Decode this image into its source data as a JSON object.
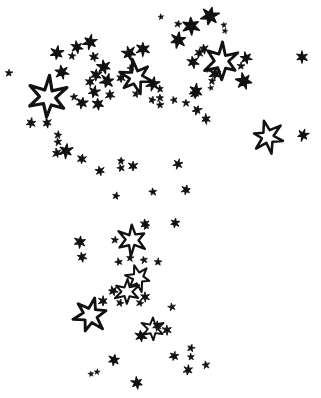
{
  "canvas": {
    "name": "star-field-illustration",
    "width": 321,
    "height": 398,
    "background_color": "#ffffff",
    "ink_color": "#111111",
    "description": "Hand-drawn black-ink star field scatter on plain white paper"
  },
  "legend": {
    "filled_style_label": "filled star",
    "outlined_style_label": "outlined star",
    "dot_style_label": "dot"
  },
  "chart_data": {
    "type": "scatter",
    "title": "",
    "subtitle": "",
    "xlabel": "",
    "ylabel": "",
    "xlim": [
      0,
      321
    ],
    "ylim": [
      0,
      398
    ],
    "grid": false,
    "legend_position": "none",
    "axis_visible": false,
    "tick_labels_x": [],
    "tick_labels_y": [],
    "annotations": [],
    "series": [
      {
        "name": "outlined star",
        "marker": "star-outline",
        "color": "#111111",
        "points": [
          {
            "x": 48,
            "y": 97,
            "size": 20
          },
          {
            "x": 136,
            "y": 77,
            "size": 17
          },
          {
            "x": 222,
            "y": 61,
            "size": 18
          },
          {
            "x": 268,
            "y": 137,
            "size": 16
          },
          {
            "x": 132,
            "y": 240,
            "size": 15
          },
          {
            "x": 138,
            "y": 278,
            "size": 13
          },
          {
            "x": 127,
            "y": 292,
            "size": 13
          },
          {
            "x": 90,
            "y": 315,
            "size": 18
          },
          {
            "x": 153,
            "y": 329,
            "size": 12
          }
        ]
      },
      {
        "name": "filled star",
        "marker": "star-filled",
        "color": "#111111",
        "points": [
          {
            "x": 210,
            "y": 16,
            "size": 9
          },
          {
            "x": 191,
            "y": 26,
            "size": 9
          },
          {
            "x": 178,
            "y": 24,
            "size": 4
          },
          {
            "x": 224,
            "y": 25,
            "size": 3
          },
          {
            "x": 225,
            "y": 31,
            "size": 3
          },
          {
            "x": 161,
            "y": 17,
            "size": 3
          },
          {
            "x": 90,
            "y": 42,
            "size": 7
          },
          {
            "x": 77,
            "y": 47,
            "size": 6
          },
          {
            "x": 57,
            "y": 53,
            "size": 7
          },
          {
            "x": 94,
            "y": 57,
            "size": 5
          },
          {
            "x": 72,
            "y": 56,
            "size": 4
          },
          {
            "x": 104,
            "y": 67,
            "size": 7
          },
          {
            "x": 96,
            "y": 75,
            "size": 6
          },
          {
            "x": 62,
            "y": 72,
            "size": 7
          },
          {
            "x": 9,
            "y": 73,
            "size": 4
          },
          {
            "x": 129,
            "y": 53,
            "size": 7
          },
          {
            "x": 143,
            "y": 49,
            "size": 7
          },
          {
            "x": 131,
            "y": 68,
            "size": 4
          },
          {
            "x": 121,
            "y": 78,
            "size": 5
          },
          {
            "x": 107,
            "y": 81,
            "size": 7
          },
          {
            "x": 90,
            "y": 82,
            "size": 5
          },
          {
            "x": 94,
            "y": 92,
            "size": 6
          },
          {
            "x": 110,
            "y": 95,
            "size": 5
          },
          {
            "x": 153,
            "y": 84,
            "size": 7
          },
          {
            "x": 160,
            "y": 89,
            "size": 4
          },
          {
            "x": 178,
            "y": 40,
            "size": 8
          },
          {
            "x": 204,
            "y": 49,
            "size": 5
          },
          {
            "x": 199,
            "y": 53,
            "size": 5
          },
          {
            "x": 193,
            "y": 62,
            "size": 6
          },
          {
            "x": 215,
            "y": 74,
            "size": 6
          },
          {
            "x": 208,
            "y": 70,
            "size": 3
          },
          {
            "x": 212,
            "y": 81,
            "size": 4
          },
          {
            "x": 211,
            "y": 88,
            "size": 3
          },
          {
            "x": 196,
            "y": 91,
            "size": 7
          },
          {
            "x": 246,
            "y": 58,
            "size": 6
          },
          {
            "x": 241,
            "y": 66,
            "size": 4
          },
          {
            "x": 244,
            "y": 81,
            "size": 8
          },
          {
            "x": 302,
            "y": 57,
            "size": 6
          },
          {
            "x": 303,
            "y": 135,
            "size": 6
          },
          {
            "x": 160,
            "y": 98,
            "size": 4
          },
          {
            "x": 152,
            "y": 100,
            "size": 4
          },
          {
            "x": 160,
            "y": 105,
            "size": 4
          },
          {
            "x": 136,
            "y": 94,
            "size": 4
          },
          {
            "x": 74,
            "y": 97,
            "size": 4
          },
          {
            "x": 82,
            "y": 103,
            "size": 6
          },
          {
            "x": 98,
            "y": 104,
            "size": 6
          },
          {
            "x": 31,
            "y": 123,
            "size": 5
          },
          {
            "x": 47,
            "y": 123,
            "size": 5
          },
          {
            "x": 58,
            "y": 135,
            "size": 4
          },
          {
            "x": 58,
            "y": 142,
            "size": 4
          },
          {
            "x": 66,
            "y": 151,
            "size": 7
          },
          {
            "x": 57,
            "y": 153,
            "size": 5
          },
          {
            "x": 82,
            "y": 159,
            "size": 5
          },
          {
            "x": 100,
            "y": 171,
            "size": 5
          },
          {
            "x": 121,
            "y": 161,
            "size": 4
          },
          {
            "x": 121,
            "y": 168,
            "size": 4
          },
          {
            "x": 133,
            "y": 166,
            "size": 5
          },
          {
            "x": 174,
            "y": 100,
            "size": 4
          },
          {
            "x": 186,
            "y": 103,
            "size": 4
          },
          {
            "x": 197,
            "y": 110,
            "size": 5
          },
          {
            "x": 206,
            "y": 119,
            "size": 5
          },
          {
            "x": 178,
            "y": 164,
            "size": 5
          },
          {
            "x": 195,
            "y": 94,
            "size": 5
          },
          {
            "x": 116,
            "y": 196,
            "size": 4
          },
          {
            "x": 153,
            "y": 192,
            "size": 4
          },
          {
            "x": 186,
            "y": 190,
            "size": 5
          },
          {
            "x": 145,
            "y": 224,
            "size": 5
          },
          {
            "x": 175,
            "y": 223,
            "size": 5
          },
          {
            "x": 146,
            "y": 226,
            "size": 4
          },
          {
            "x": 80,
            "y": 242,
            "size": 6
          },
          {
            "x": 82,
            "y": 257,
            "size": 5
          },
          {
            "x": 115,
            "y": 240,
            "size": 4
          },
          {
            "x": 144,
            "y": 260,
            "size": 4
          },
          {
            "x": 130,
            "y": 258,
            "size": 4
          },
          {
            "x": 119,
            "y": 262,
            "size": 4
          },
          {
            "x": 158,
            "y": 262,
            "size": 4
          },
          {
            "x": 113,
            "y": 291,
            "size": 5
          },
          {
            "x": 103,
            "y": 301,
            "size": 5
          },
          {
            "x": 120,
            "y": 303,
            "size": 4
          },
          {
            "x": 145,
            "y": 297,
            "size": 5
          },
          {
            "x": 140,
            "y": 303,
            "size": 4
          },
          {
            "x": 167,
            "y": 330,
            "size": 5
          },
          {
            "x": 191,
            "y": 348,
            "size": 4
          },
          {
            "x": 191,
            "y": 357,
            "size": 4
          },
          {
            "x": 174,
            "y": 356,
            "size": 5
          },
          {
            "x": 141,
            "y": 336,
            "size": 6
          },
          {
            "x": 114,
            "y": 360,
            "size": 6
          },
          {
            "x": 91,
            "y": 374,
            "size": 3
          },
          {
            "x": 97,
            "y": 372,
            "size": 3
          },
          {
            "x": 137,
            "y": 383,
            "size": 6
          },
          {
            "x": 188,
            "y": 370,
            "size": 5
          },
          {
            "x": 206,
            "y": 365,
            "size": 4
          },
          {
            "x": 157,
            "y": 326,
            "size": 5
          },
          {
            "x": 172,
            "y": 307,
            "size": 4
          }
        ]
      }
    ]
  }
}
